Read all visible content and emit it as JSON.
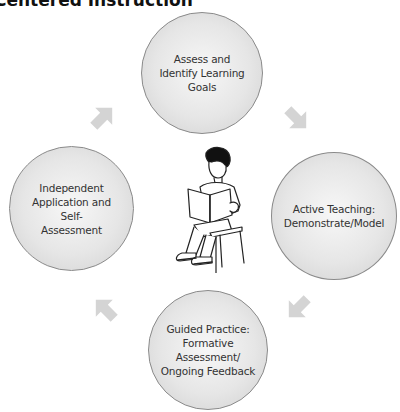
{
  "title": "Centered Instruction",
  "cycle": [
    {
      "id": "assess",
      "label": "Assess and\nIdentify Learning\nGoals"
    },
    {
      "id": "active-teaching",
      "label": "Active Teaching:\nDemonstrate/Model"
    },
    {
      "id": "guided-practice",
      "label": "Guided Practice:\nFormative\nAssessment/\nOngoing Feedback"
    },
    {
      "id": "independent",
      "label": "Independent\nApplication and Self-\nAssessment"
    }
  ],
  "center_image": "child-reading-book-on-chair",
  "colors": {
    "circle_fill": "#e6e6e6",
    "circle_border": "#8a8a8a",
    "arrow": "#d4d4d4",
    "text": "#333333"
  }
}
